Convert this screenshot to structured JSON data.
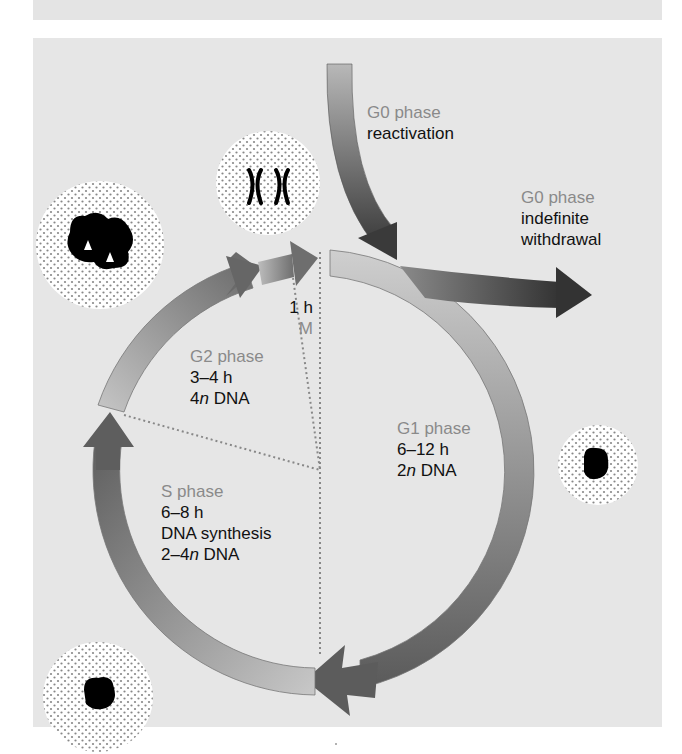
{
  "figure": {
    "type": "cell-cycle-diagram",
    "colors": {
      "background": "#ffffff",
      "panel": "#e6e6e6",
      "phase_label": "#8a8a8a",
      "text": "#111111",
      "arrow_dark": "#555555",
      "arrow_light": "#c8c8c8",
      "chromatin": "#000000"
    }
  },
  "labels": {
    "g0_reactivation": {
      "phase": "G0 phase",
      "desc": "reactivation"
    },
    "g0_withdrawal": {
      "phase": "G0 phase",
      "desc1": "indefinite",
      "desc2": "withdrawal"
    },
    "m_phase": {
      "duration": "1 h",
      "phase": "M"
    },
    "g2_phase": {
      "phase": "G2 phase",
      "duration": "3–4 h",
      "dna_num": "4",
      "dna_n": "n",
      "dna_rest": " DNA"
    },
    "g1_phase": {
      "phase": "G1 phase",
      "duration": "6–12 h",
      "dna_num": "2",
      "dna_n": "n",
      "dna_rest": " DNA"
    },
    "s_phase": {
      "phase": "S phase",
      "duration": "6–8 h",
      "activity": "DNA synthesis",
      "dna_num": "2–4",
      "dna_n": "n",
      "dna_rest": " DNA"
    }
  },
  "cells": [
    {
      "name": "g2-cell",
      "position": "upper-left"
    },
    {
      "name": "mitosis-cell",
      "position": "top",
      "content": "two chromosomes"
    },
    {
      "name": "g1-cell",
      "position": "right"
    },
    {
      "name": "s-cell",
      "position": "lower-left"
    }
  ]
}
